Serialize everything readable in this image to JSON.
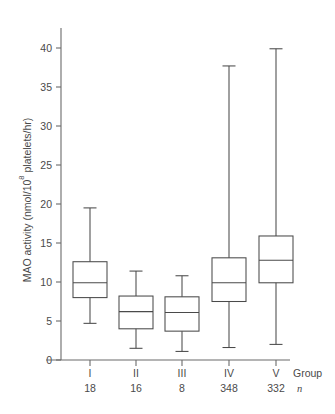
{
  "chart_data": {
    "type": "box",
    "title": "",
    "xlabel": "Group",
    "ylabel": "MAO activity (nmol/10⁸ platelets/hr)",
    "ylabel_parts": {
      "pre": "MAO activity (nmol/10",
      "sup": "8",
      "post": " platelets/hr)"
    },
    "ylim": [
      0,
      43
    ],
    "yticks": [
      0,
      5,
      10,
      15,
      20,
      25,
      30,
      35,
      40
    ],
    "ytick_labels": [
      "0",
      "5",
      "10",
      "15",
      "20",
      "25",
      "30",
      "35",
      "40"
    ],
    "grid": false,
    "legend": "none",
    "categories": [
      "I",
      "II",
      "III",
      "IV",
      "V"
    ],
    "row_labels": {
      "group": "Group",
      "n": "n"
    },
    "n_values": [
      "18",
      "16",
      "8",
      "348",
      "332"
    ],
    "boxes": [
      {
        "category": "I",
        "n": 18,
        "whisker_low": 4.7,
        "q1": 8.0,
        "median": 9.9,
        "q3": 12.6,
        "whisker_high": 19.5
      },
      {
        "category": "II",
        "n": 16,
        "whisker_low": 1.5,
        "q1": 4.0,
        "median": 6.2,
        "q3": 8.2,
        "whisker_high": 11.4
      },
      {
        "category": "III",
        "n": 8,
        "whisker_low": 1.1,
        "q1": 3.7,
        "median": 6.1,
        "q3": 8.1,
        "whisker_high": 10.8
      },
      {
        "category": "IV",
        "n": 348,
        "whisker_low": 1.6,
        "q1": 7.5,
        "median": 9.9,
        "q3": 13.1,
        "whisker_high": 37.7
      },
      {
        "category": "V",
        "n": 332,
        "whisker_low": 2.0,
        "q1": 9.9,
        "median": 12.8,
        "q3": 15.9,
        "whisker_high": 39.9
      }
    ],
    "colors": {
      "axis": "#6b6b6b",
      "box_stroke": "#4a4a4a",
      "text": "#4a4a4a",
      "background": "#ffffff"
    }
  }
}
